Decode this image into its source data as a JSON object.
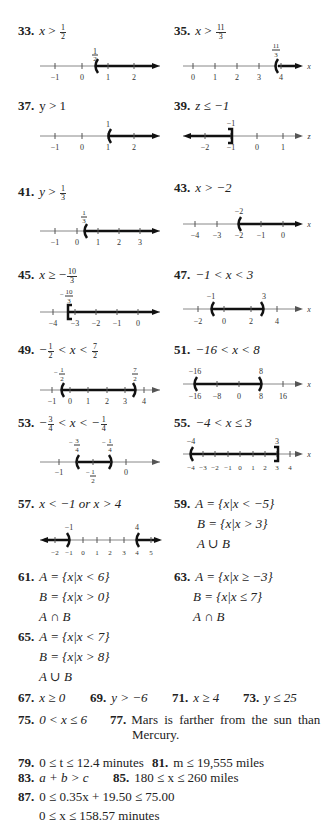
{
  "problems": {
    "p33": {
      "num": "33.",
      "var": "x",
      "op": ">",
      "rhs_n": "1",
      "rhs_d": "2"
    },
    "p35": {
      "num": "35.",
      "var": "x",
      "op": ">",
      "rhs_n": "11",
      "rhs_d": "3"
    },
    "p37": {
      "num": "37.",
      "text": "y > 1"
    },
    "p39": {
      "num": "39.",
      "text": "z ≤ −1"
    },
    "p41": {
      "num": "41.",
      "var": "y",
      "op": ">",
      "rhs_n": "1",
      "rhs_d": "3"
    },
    "p43": {
      "num": "43.",
      "text": "x > −2"
    },
    "p45": {
      "num": "45.",
      "var": "x",
      "op": "≥ −",
      "rhs_n": "10",
      "rhs_d": "3"
    },
    "p47": {
      "num": "47.",
      "text": "−1 < x < 3"
    },
    "p49": {
      "num": "49.",
      "lead": "−",
      "l_n": "1",
      "l_d": "2",
      "mid": "< x <",
      "r_n": "7",
      "r_d": "2"
    },
    "p51": {
      "num": "51.",
      "text": "−16 < x < 8"
    },
    "p53": {
      "num": "53.",
      "lead": "−",
      "l_n": "3",
      "l_d": "4",
      "mid": "< x < −",
      "r_n": "1",
      "r_d": "4"
    },
    "p55": {
      "num": "55.",
      "text": "−4 < x ≤ 3"
    },
    "p57": {
      "num": "57.",
      "text": "x < −1 or x > 4"
    },
    "p59": {
      "num": "59.",
      "lines": [
        "A = {x|x < −5}",
        "B = {x|x > 3}",
        "A ∪ B"
      ]
    },
    "p61": {
      "num": "61.",
      "lines": [
        "A = {x|x < 6}",
        "B = {x|x > 0}",
        "A ∩ B"
      ]
    },
    "p63": {
      "num": "63.",
      "lines": [
        "A = {x|x ≥ −3}",
        "B = {x|x ≤ 7}",
        "A ∩ B"
      ]
    },
    "p65": {
      "num": "65.",
      "lines": [
        "A = {x|x < 7}",
        "B = {x|x > 8}",
        "A ∪ B"
      ]
    },
    "p67": {
      "num": "67.",
      "text": "x ≥ 0"
    },
    "p69": {
      "num": "69.",
      "text": "y > −6"
    },
    "p71": {
      "num": "71.",
      "text": "x ≥ 4"
    },
    "p73": {
      "num": "73.",
      "text": "y ≤ 25"
    },
    "p75": {
      "num": "75.",
      "text": "0 < x ≤ 6"
    },
    "p77": {
      "num": "77.",
      "text": "Mars is farther from the sun than",
      "text2": "Mercury."
    },
    "p79": {
      "num": "79.",
      "text": "0 ≤ t ≤ 12.4 minutes"
    },
    "p81": {
      "num": "81.",
      "text": "m ≤ 19,555 miles"
    },
    "p83": {
      "num": "83.",
      "text": "a + b > c"
    },
    "p85": {
      "num": "85.",
      "text": "180 ≤ x ≤ 260 miles"
    },
    "p87": {
      "num": "87.",
      "text": "0 ≤ 0.35x + 19.50 ≤ 75.00",
      "text2": "0 ≤ x ≤ 158.57 minutes"
    }
  },
  "number_lines": {
    "nl33": {
      "axis": "x",
      "ticks": [
        "−1",
        "0",
        "1",
        "2"
      ],
      "mark": "1/2"
    },
    "nl35": {
      "axis": "x",
      "ticks": [
        "0",
        "1",
        "2",
        "3",
        "4"
      ],
      "mark": "11/3"
    },
    "nl37": {
      "axis": "y",
      "ticks": [
        "−1",
        "0",
        "1",
        "2"
      ],
      "mark": "1"
    },
    "nl39": {
      "axis": "z",
      "ticks": [
        "−2",
        "−1",
        "0",
        "1"
      ],
      "mark": "−1"
    },
    "nl41": {
      "axis": "y",
      "ticks": [
        "−1",
        "0",
        "1",
        "2",
        "3"
      ],
      "mark": "1/3"
    },
    "nl43": {
      "axis": "x",
      "ticks": [
        "−4",
        "−3",
        "−2",
        "−1",
        "0"
      ],
      "mark": "−2"
    },
    "nl45": {
      "axis": "x",
      "ticks": [
        "−4",
        "−3",
        "−2",
        "−1",
        "0"
      ],
      "mark": "−10/3"
    },
    "nl47": {
      "axis": "x",
      "ticks": [
        "−2",
        "0",
        "2",
        "4"
      ],
      "mark_l": "−1",
      "mark_r": "3"
    },
    "nl49": {
      "axis": "x",
      "ticks": [
        "−1",
        "0",
        "1",
        "2",
        "3",
        "4"
      ],
      "mark_l": "−1/2",
      "mark_r": "7/2"
    },
    "nl51": {
      "axis": "x",
      "ticks": [
        "−16",
        "−8",
        "0",
        "8",
        "16"
      ],
      "mark_l": "−16",
      "mark_r": "8"
    },
    "nl53": {
      "axis": "x",
      "ticks": [
        "−1",
        "0"
      ],
      "below": "−1/2",
      "mark_l": "−3/4",
      "mark_r": "−1/4"
    },
    "nl55": {
      "axis": "x",
      "ticks": [
        "−4",
        "−3",
        "−2",
        "−1",
        "0",
        "1",
        "2",
        "3",
        "4"
      ],
      "mark_l": "−4",
      "mark_r": "3"
    },
    "nl57": {
      "axis": "x",
      "ticks": [
        "−2",
        "−1",
        "0",
        "1",
        "2",
        "3",
        "4",
        "5"
      ],
      "mark_l": "−1",
      "mark_r": "4"
    }
  }
}
